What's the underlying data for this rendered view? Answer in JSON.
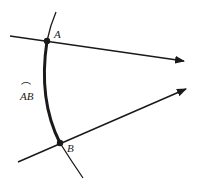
{
  "diagram": {
    "type": "geometry-arc-between-rays",
    "colors": {
      "stroke": "#1a1a1a",
      "background": "#ffffff"
    },
    "points": [
      {
        "id": "A",
        "label": "A",
        "x": 47,
        "y": 41
      },
      {
        "id": "B",
        "label": "B",
        "x": 60,
        "y": 143
      }
    ],
    "rays": [
      {
        "id": "upper-ray",
        "from": [
          10,
          36
        ],
        "to": [
          186,
          61
        ]
      },
      {
        "id": "lower-ray",
        "from": [
          18,
          162
        ],
        "to": [
          188,
          88
        ]
      }
    ],
    "arc": {
      "label_main": "AB",
      "label_accent": "⌒",
      "start": [
        56,
        12
      ],
      "end": [
        83,
        178
      ]
    }
  }
}
